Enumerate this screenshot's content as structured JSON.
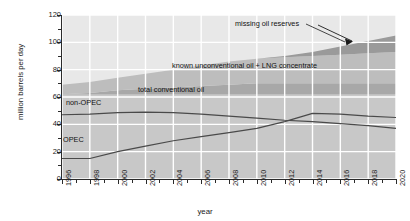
{
  "chart_data": {
    "type": "area",
    "title": "",
    "subtitle": "",
    "xlabel": "year",
    "ylabel": "million barrels per day",
    "xlim": [
      1996,
      2020
    ],
    "ylim": [
      0,
      120
    ],
    "ytick_step": 20,
    "ytick_minor_step": 10,
    "xtick_step": 2,
    "xtick_minor_step": 1,
    "grid": true,
    "legend_position": "inline-annotations",
    "x": [
      1996,
      1998,
      2000,
      2002,
      2004,
      2006,
      2008,
      2010,
      2012,
      2014,
      2016,
      2018,
      2020
    ],
    "ytick_labels": [
      "0",
      "20",
      "40",
      "60",
      "80",
      "100",
      "120"
    ],
    "xtick_labels": [
      "1996",
      "1998",
      "2000",
      "2002",
      "2004",
      "2006",
      "2008",
      "2010",
      "2012",
      "2014",
      "2016",
      "2018",
      "2020"
    ],
    "stacked_series": [
      {
        "name": "total conventional oil",
        "color": "#a8a8a8",
        "values": [
          62,
          63,
          65,
          66,
          67,
          68,
          69,
          70,
          70,
          70,
          70,
          70,
          70
        ]
      },
      {
        "name": "known unconventional oil + LNG concentrate",
        "color": "#bdbdbd",
        "values": [
          7,
          8,
          9,
          11,
          13,
          15,
          17,
          18,
          19,
          20,
          21,
          22,
          23
        ]
      },
      {
        "name": "missing oil reserves",
        "color": "#9a9a9a",
        "values": [
          0,
          0,
          0,
          0,
          0,
          0,
          0,
          0,
          1,
          3,
          6,
          9,
          12
        ]
      }
    ],
    "line_series": [
      {
        "name": "non-OPEC",
        "color": "#4a4a4a",
        "values": [
          47,
          47.5,
          48.5,
          49,
          48.5,
          47.5,
          46,
          44.5,
          43,
          42,
          40.5,
          39,
          37
        ]
      },
      {
        "name": "OPEC",
        "color": "#4a4a4a",
        "values": [
          15,
          15,
          20,
          24,
          28,
          31,
          34,
          37,
          42,
          48,
          47.5,
          46,
          45
        ]
      }
    ],
    "annotations": [
      {
        "id": "missing-oil-reserves",
        "text": "missing oil reserves",
        "arrow": true,
        "arrow_to_year": 2016,
        "arrow_to_value": 103
      },
      {
        "id": "known-unconventional",
        "text": "known unconventional oil + LNG concentrate",
        "arrow": false
      },
      {
        "id": "total-conventional",
        "text": "total conventional oil",
        "arrow": false
      },
      {
        "id": "non-opec",
        "text": "non-OPEC",
        "arrow": false
      },
      {
        "id": "opec",
        "text": "OPEC",
        "arrow": false
      }
    ],
    "colors": {
      "plot_background": "#c8c8c8",
      "gridline": "#ffffff",
      "axis": "#2b2b2b",
      "band_top_light": "#e8e8e8",
      "line": "#4a4a4a"
    }
  },
  "axis": {
    "y_title": "million barrels per day",
    "x_title": "year"
  },
  "labels": {
    "missing": "missing oil reserves",
    "unconventional": "known unconventional oil + LNG concentrate",
    "conventional": "total conventional oil",
    "non_opec": "non-OPEC",
    "opec": "OPEC"
  }
}
